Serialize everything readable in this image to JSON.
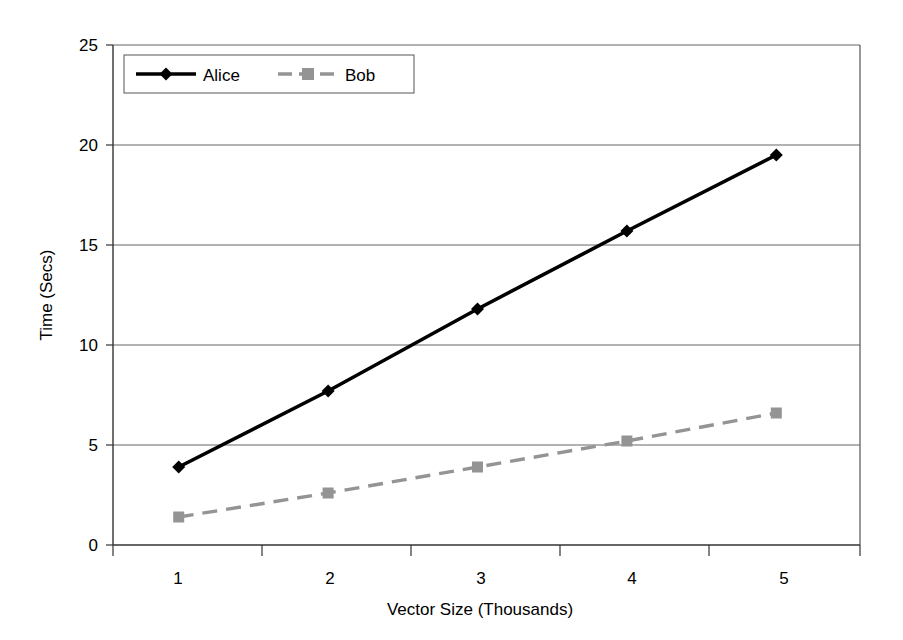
{
  "chart_data": {
    "type": "line",
    "title": "",
    "xlabel": "Vector Size (Thousands)",
    "ylabel": "Time (Secs)",
    "categories": [
      "1",
      "2",
      "3",
      "4",
      "5"
    ],
    "series": [
      {
        "name": "Alice",
        "values": [
          3.9,
          7.7,
          11.8,
          15.7,
          19.5
        ],
        "color": "#000000",
        "marker": "diamond",
        "linestyle": "solid"
      },
      {
        "name": "Bob",
        "values": [
          1.4,
          2.6,
          3.9,
          5.2,
          6.6
        ],
        "color": "#949494",
        "marker": "square",
        "linestyle": "dashed"
      }
    ],
    "ylim": [
      0,
      25
    ],
    "yticks": [
      "0",
      "5",
      "10",
      "15",
      "20",
      "25"
    ],
    "grid": "horizontal",
    "legend_position": "top-left-inside"
  },
  "legend": {
    "entries": [
      {
        "label": "Alice"
      },
      {
        "label": "Bob"
      }
    ]
  },
  "axes": {
    "y_title": "Time (Secs)",
    "x_title": "Vector Size (Thousands)",
    "y_ticks": [
      "25",
      "20",
      "15",
      "10",
      "5",
      "0"
    ],
    "x_ticks": [
      "1",
      "2",
      "3",
      "4",
      "5"
    ]
  }
}
